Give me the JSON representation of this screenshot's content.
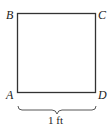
{
  "diagram": {
    "shape": "square",
    "vertices": {
      "top_left": "B",
      "top_right": "C",
      "bottom_left": "A",
      "bottom_right": "D"
    },
    "side_label": "1 ft",
    "colors": {
      "stroke": "#333333",
      "background": "#ffffff"
    }
  }
}
